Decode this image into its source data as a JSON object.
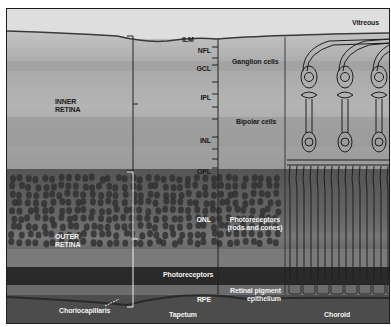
{
  "figure": {
    "colors": {
      "vitreous": "#dcdcdc",
      "inner_retina": "#ababab",
      "outer_nuclear": "#5a5a5a",
      "photoreceptor_band": "#2c2c2c",
      "choroid": "#4a4a4a",
      "label_dark": "#1a1a1a",
      "label_light": "#f2f2f2"
    }
  },
  "labels": {
    "vitreous": "Vitreous",
    "ilm": "ILM",
    "inner_retina_line1": "INNER",
    "inner_retina_line2": "RETINA",
    "outer_retina_line1": "OUTER",
    "outer_retina_line2": "RETINA",
    "nfl": "NFL",
    "gcl": "GCL",
    "ipl": "IPL",
    "inl": "INL",
    "opl": "OPL",
    "onl": "ONL",
    "rpe": "RPE",
    "ganglion_cells": "Ganglion cells",
    "bipolar_cells": "Bipolar cells",
    "photoreceptors_line1": "Photoreceptors",
    "photoreceptors_line2": "(rods and cones)",
    "photoreceptors_left": "Photoreceptors",
    "rpe_line1": "Retinal pigment",
    "rpe_line2": "epithelium",
    "choriocapillaris": "Choriocapillaris",
    "tapetum": "Tapetum",
    "choroid": "Choroid"
  }
}
